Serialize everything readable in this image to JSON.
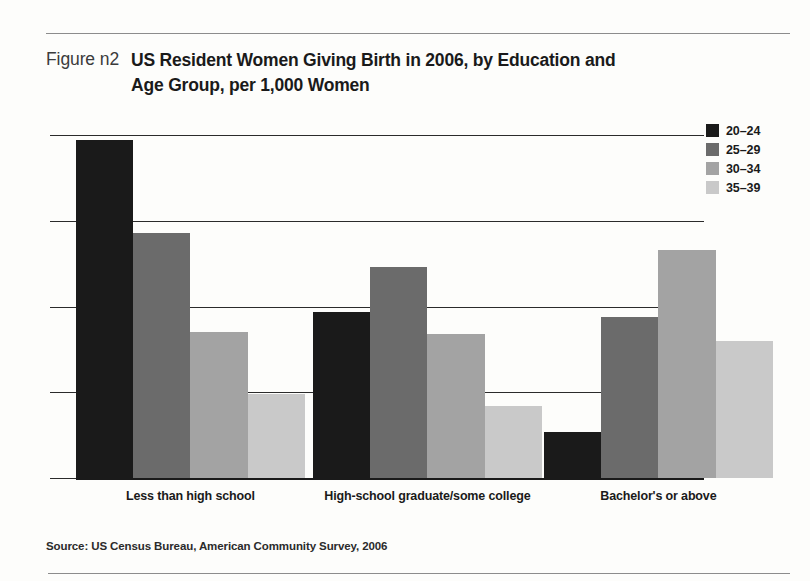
{
  "figure": {
    "number_label": "Figure n2",
    "title": "US Resident Women Giving Birth in 2006, by Education and Age Group, per 1,000 Women",
    "source": "Source: US Census Bureau, American Community Survey, 2006"
  },
  "legend": {
    "items": [
      {
        "label": "20–24",
        "color": "#1a1a1a"
      },
      {
        "label": "25–29",
        "color": "#6b6b6b"
      },
      {
        "label": "30–34",
        "color": "#a3a3a3"
      },
      {
        "label": "35–39",
        "color": "#c9c9c9"
      }
    ]
  },
  "chart_data": {
    "type": "bar",
    "title": "US Resident Women Giving Birth in 2006, by Education and Age Group, per 1,000 Women",
    "xlabel": "",
    "ylabel": "",
    "ylim": [
      0,
      200
    ],
    "yticks": [
      0,
      50,
      100,
      150,
      200
    ],
    "ytick_labels": [
      "0",
      "50",
      "100",
      "150",
      "200"
    ],
    "grid": true,
    "legend_position": "top-right",
    "categories": [
      "Less than high school",
      "High-school graduate/some college",
      "Bachelor's or above"
    ],
    "series": [
      {
        "name": "20–24",
        "color": "#1a1a1a",
        "values": [
          197,
          97,
          27
        ]
      },
      {
        "name": "25–29",
        "color": "#6b6b6b",
        "values": [
          143,
          123,
          94
        ]
      },
      {
        "name": "30–34",
        "color": "#a3a3a3",
        "values": [
          85,
          84,
          133
        ]
      },
      {
        "name": "35–39",
        "color": "#c9c9c9",
        "values": [
          49,
          42,
          80
        ]
      }
    ]
  }
}
